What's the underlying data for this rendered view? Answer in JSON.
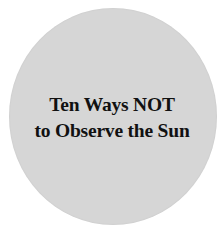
{
  "colors": {
    "background": "#ffffff",
    "disc": "#d6d6d6",
    "text": "#111111"
  },
  "title": {
    "line1": "Ten Ways NOT",
    "line2": "to Observe the Sun"
  }
}
